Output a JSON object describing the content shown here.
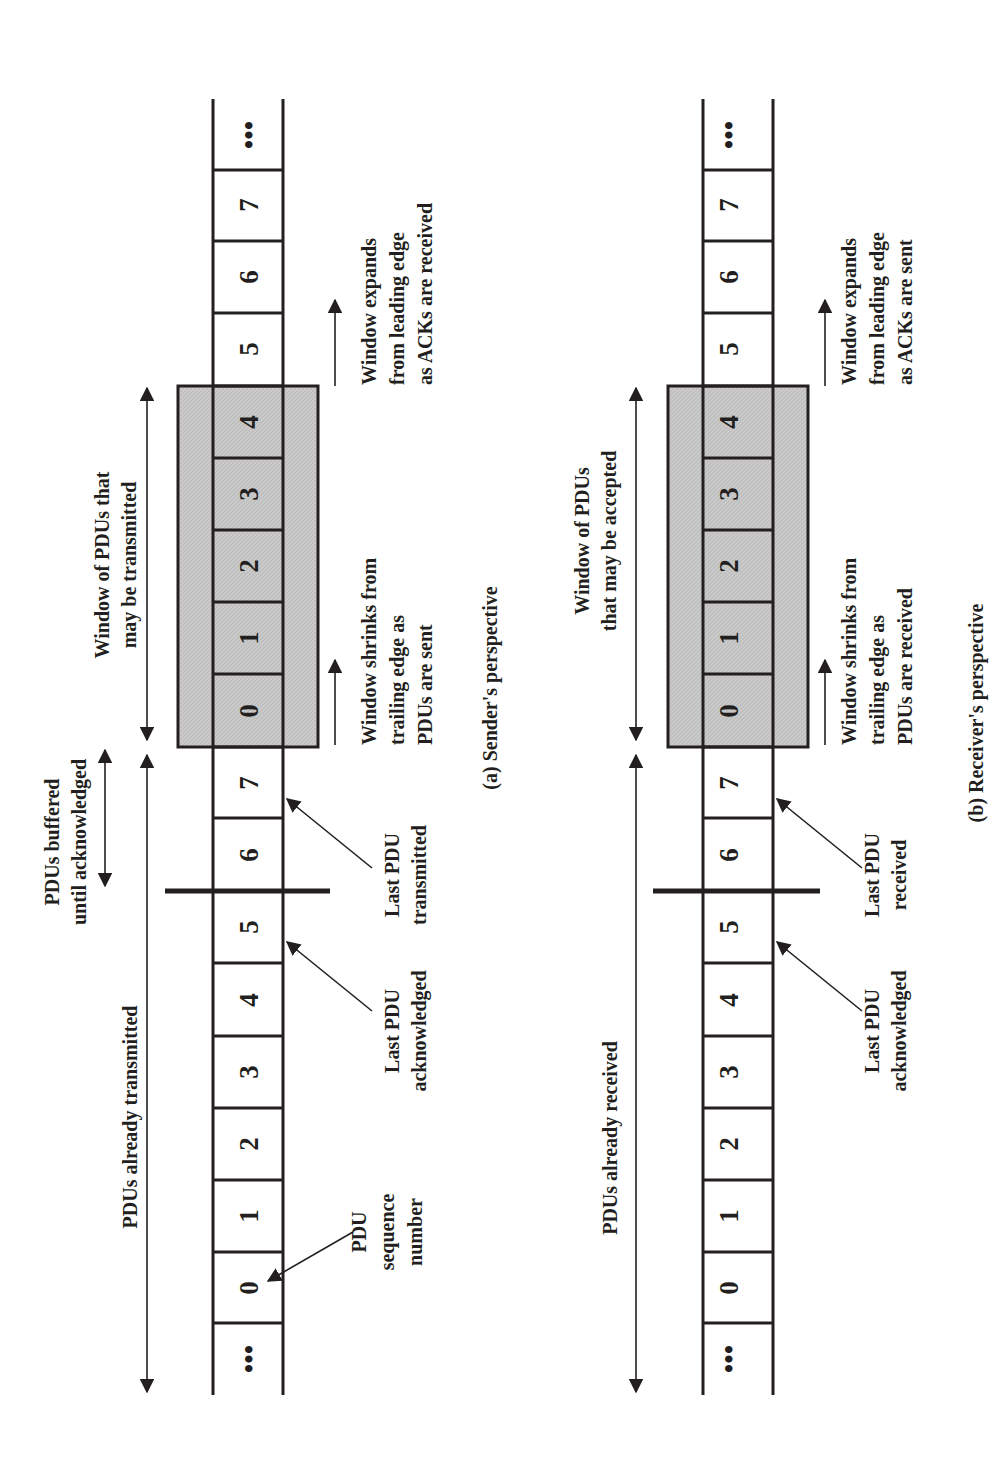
{
  "diagram": {
    "type": "sliding-window",
    "orientation": "rotated-90-ccw",
    "colors": {
      "ink": "#231f20",
      "window_fill": "#c8c8c8",
      "background": "#ffffff"
    },
    "panels": [
      {
        "id": "sender",
        "caption": "(a) Sender's perspective",
        "cells": [
          "•••",
          "0",
          "1",
          "2",
          "3",
          "4",
          "5",
          "6",
          "7",
          "0",
          "1",
          "2",
          "3",
          "4",
          "5",
          "6",
          "7",
          "•••"
        ],
        "window_cells": [
          "0",
          "1",
          "2",
          "3",
          "4"
        ],
        "labels": {
          "already": "PDUs already transmitted",
          "window": [
            "Window of PDUs that",
            "may be transmitted"
          ],
          "buffered": [
            "PDUs buffered",
            "until acknowledged"
          ],
          "seqnum": [
            "PDU",
            "sequence",
            "number"
          ],
          "last_ack": [
            "Last PDU",
            "acknowledged"
          ],
          "last_other": [
            "Last PDU",
            "transmitted"
          ],
          "shrinks": [
            "Window shrinks from",
            "trailing edge as",
            "PDUs are sent"
          ],
          "expands": [
            "Window expands",
            "from leading edge",
            "as ACKs are received"
          ]
        }
      },
      {
        "id": "receiver",
        "caption": "(b) Receiver's perspective",
        "cells": [
          "•••",
          "0",
          "1",
          "2",
          "3",
          "4",
          "5",
          "6",
          "7",
          "0",
          "1",
          "2",
          "3",
          "4",
          "5",
          "6",
          "7",
          "•••"
        ],
        "window_cells": [
          "0",
          "1",
          "2",
          "3",
          "4"
        ],
        "labels": {
          "already": "PDUs already received",
          "window": [
            "Window of PDUs",
            "that may be accepted"
          ],
          "last_ack": [
            "Last PDU",
            "acknowledged"
          ],
          "last_other": [
            "Last PDU",
            "received"
          ],
          "shrinks": [
            "Window shrinks from",
            "trailing edge as",
            "PDUs are received"
          ],
          "expands": [
            "Window expands",
            "from leading edge",
            "as ACKs are sent"
          ]
        }
      }
    ]
  }
}
